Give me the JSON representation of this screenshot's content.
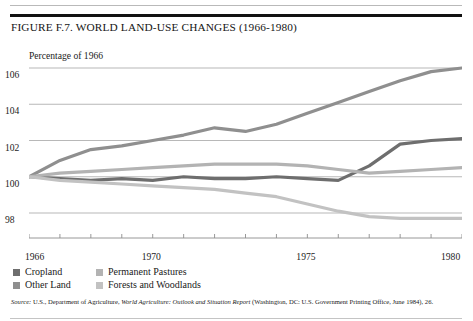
{
  "figure": {
    "title": "FIGURE F.7. WORLD LAND-USE CHANGES (1966-1980)",
    "axis_caption": "Percentage of 1966",
    "source_prefix": "Source:",
    "source_text_1": " U.S., Department of Agriculture, ",
    "source_italic": "World Agriculture: Outlook and Situation Report",
    "source_text_2": "  (Washington, DC: U.S. Government Printing Office, June 1984), 26."
  },
  "legend": {
    "items": [
      {
        "label": "Cropland",
        "color": "#6e6e6e"
      },
      {
        "label": "Permanent Pastures",
        "color": "#b3b3b3"
      },
      {
        "label": "Other Land",
        "color": "#8f8f8f"
      },
      {
        "label": "Forests and Woodlands",
        "color": "#c2c2c2"
      }
    ]
  },
  "chart_data": {
    "type": "line",
    "title": "FIGURE F.7. WORLD LAND-USE CHANGES (1966-1980)",
    "xlabel": "",
    "ylabel": "Percentage of 1966",
    "grid": true,
    "legend_position": "below-axis",
    "xlim": [
      1966,
      1980
    ],
    "ylim": [
      97,
      107
    ],
    "yticks": [
      98,
      100,
      102,
      104,
      106
    ],
    "ytick_labels": [
      "98",
      "100",
      "102",
      "104",
      "106"
    ],
    "xticks": [
      1966,
      1967,
      1968,
      1969,
      1970,
      1971,
      1972,
      1973,
      1974,
      1975,
      1976,
      1977,
      1978,
      1979,
      1980
    ],
    "xtick_labels_shown": [
      "1966",
      "1970",
      "1975",
      "1980"
    ],
    "x": [
      1966,
      1967,
      1968,
      1969,
      1970,
      1971,
      1972,
      1973,
      1974,
      1975,
      1976,
      1977,
      1978,
      1979,
      1980
    ],
    "series": [
      {
        "name": "Cropland",
        "color": "#6e6e6e",
        "values": [
          100.0,
          99.9,
          99.8,
          99.9,
          99.8,
          100.0,
          99.9,
          99.9,
          100.0,
          99.9,
          99.8,
          100.6,
          101.8,
          102.0,
          102.1
        ]
      },
      {
        "name": "Other Land",
        "color": "#8f8f8f",
        "values": [
          100.0,
          100.9,
          101.5,
          101.7,
          102.0,
          102.3,
          102.7,
          102.5,
          102.9,
          103.5,
          104.1,
          104.7,
          105.3,
          105.8,
          106.0
        ]
      },
      {
        "name": "Permanent Pastures",
        "color": "#b3b3b3",
        "values": [
          100.0,
          100.2,
          100.3,
          100.4,
          100.5,
          100.6,
          100.7,
          100.7,
          100.7,
          100.6,
          100.4,
          100.2,
          100.3,
          100.4,
          100.5
        ]
      },
      {
        "name": "Forests and Woodlands",
        "color": "#c2c2c2",
        "values": [
          100.0,
          99.8,
          99.7,
          99.6,
          99.5,
          99.4,
          99.3,
          99.1,
          98.9,
          98.5,
          98.1,
          97.8,
          97.7,
          97.7,
          97.7
        ]
      }
    ]
  }
}
